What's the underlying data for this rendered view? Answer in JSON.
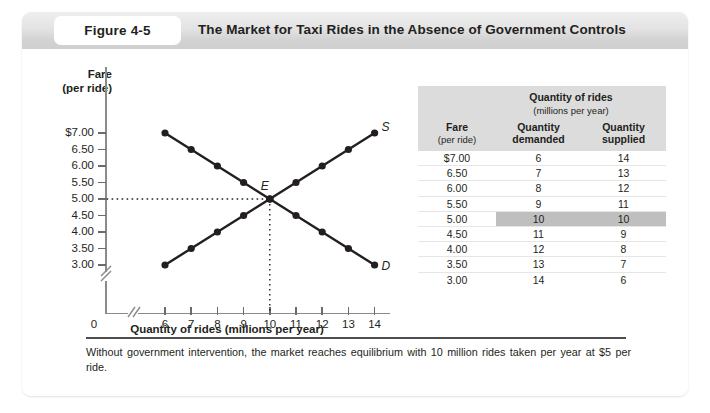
{
  "figure": {
    "tag": "Figure 4-5",
    "title": "The Market for Taxi Rides in the Absence of Government Controls",
    "caption": "Without government intervention, the market reaches equilibrium with 10 million rides taken per year at $5 per ride."
  },
  "chart_data": {
    "type": "line",
    "title": "The Market for Taxi Rides in the Absence of Government Controls",
    "xlabel": "Quantity of rides (millions per year)",
    "ylabel": "Fare (per ride)",
    "ylabel_line1": "Fare",
    "ylabel_line2": "(per ride)",
    "x_ticks": [
      6,
      7,
      8,
      9,
      10,
      11,
      12,
      13,
      14
    ],
    "x_tick_labels": [
      "6",
      "7",
      "8",
      "9",
      "10",
      "11",
      "12",
      "13",
      "14"
    ],
    "origin_label": "0",
    "y_ticks": [
      3.0,
      3.5,
      4.0,
      4.5,
      5.0,
      5.5,
      6.0,
      6.5,
      7.0
    ],
    "y_tick_labels": [
      "$7.00",
      "6.50",
      "6.00",
      "5.50",
      "5.00",
      "4.50",
      "4.00",
      "3.50",
      "3.00"
    ],
    "xlim": [
      6,
      14
    ],
    "ylim": [
      3.0,
      7.0
    ],
    "axis_break_x": true,
    "axis_break_y": true,
    "grid": false,
    "legend": "none",
    "series": [
      {
        "name": "Demand",
        "label": "D",
        "x": [
          6,
          7,
          8,
          9,
          10,
          11,
          12,
          13,
          14
        ],
        "y": [
          7.0,
          6.5,
          6.0,
          5.5,
          5.0,
          4.5,
          4.0,
          3.5,
          3.0
        ]
      },
      {
        "name": "Supply",
        "label": "S",
        "x": [
          6,
          7,
          8,
          9,
          10,
          11,
          12,
          13,
          14
        ],
        "y": [
          3.0,
          3.5,
          4.0,
          4.5,
          5.0,
          5.5,
          6.0,
          6.5,
          7.0
        ]
      }
    ],
    "annotations": [
      {
        "label": "E",
        "x": 10,
        "y": 5.0,
        "note": "equilibrium point"
      }
    ],
    "guide_lines": [
      {
        "orientation": "horizontal",
        "value": 5.0,
        "style": "dotted"
      },
      {
        "orientation": "vertical",
        "value": 10,
        "style": "dotted"
      }
    ]
  },
  "table": {
    "span_header": "Quantity of rides",
    "span_subheader": "(millions per year)",
    "columns": [
      {
        "line1": "Fare",
        "line2": "(per ride)"
      },
      {
        "line1": "Quantity",
        "line2": "demanded"
      },
      {
        "line1": "Quantity",
        "line2": "supplied"
      }
    ],
    "rows": [
      {
        "fare": "$7.00",
        "demanded": "6",
        "supplied": "14",
        "highlight": false
      },
      {
        "fare": "6.50",
        "demanded": "7",
        "supplied": "13",
        "highlight": false
      },
      {
        "fare": "6.00",
        "demanded": "8",
        "supplied": "12",
        "highlight": false
      },
      {
        "fare": "5.50",
        "demanded": "9",
        "supplied": "11",
        "highlight": false
      },
      {
        "fare": "5.00",
        "demanded": "10",
        "supplied": "10",
        "highlight": true
      },
      {
        "fare": "4.50",
        "demanded": "11",
        "supplied": "9",
        "highlight": false
      },
      {
        "fare": "4.00",
        "demanded": "12",
        "supplied": "8",
        "highlight": false
      },
      {
        "fare": "3.50",
        "demanded": "13",
        "supplied": "7",
        "highlight": false
      },
      {
        "fare": "3.00",
        "demanded": "14",
        "supplied": "6",
        "highlight": false
      }
    ]
  },
  "colors": {
    "curve": "#231f20",
    "highlight": "#bfbfbf",
    "header_bar": "#dcdcdc",
    "text": "#231f20"
  }
}
